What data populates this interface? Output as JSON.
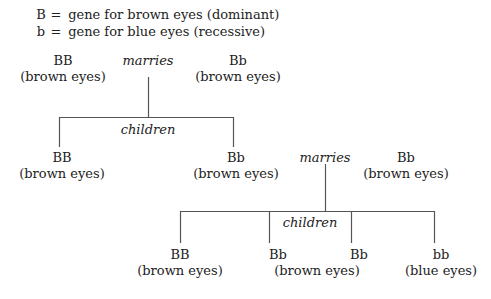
{
  "legend": [
    {
      "symbol": "B",
      "eq": "=",
      "text": "gene for brown eyes (dominant)"
    },
    {
      "symbol": "b",
      "eq": "=",
      "text": "gene for blue eyes (recessive)"
    }
  ],
  "generation1": {
    "parent_left": {
      "genotype": "BB",
      "phenotype": "(brown eyes)"
    },
    "relation": "marries",
    "parent_right": {
      "genotype": "Bb",
      "phenotype": "(brown eyes)"
    },
    "children_label": "children",
    "children": [
      {
        "genotype": "BB",
        "phenotype": "(brown eyes)"
      },
      {
        "genotype": "Bb",
        "phenotype": "(brown eyes)"
      }
    ]
  },
  "generation2": {
    "relation": "marries",
    "spouse": {
      "genotype": "Bb",
      "phenotype": "(brown eyes)"
    },
    "children_label": "children",
    "children": [
      {
        "genotype": "BB",
        "phenotype": "(brown eyes)"
      },
      {
        "genotype": "Bb",
        "phenotype": ""
      },
      {
        "genotype": "Bb",
        "phenotype": ""
      },
      {
        "genotype": "bb",
        "phenotype": "(blue eyes)"
      }
    ],
    "shared_phenotype": "(brown eyes)"
  },
  "colors": {
    "text": "#222222",
    "line": "#555555",
    "background": "#ffffff"
  }
}
